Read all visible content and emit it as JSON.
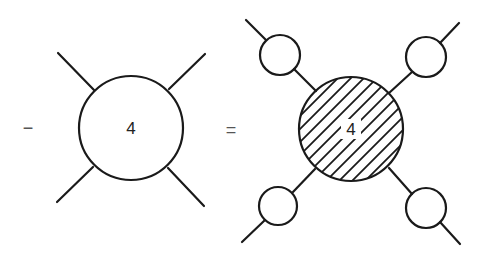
{
  "equation": {
    "lhs_operator": "−",
    "equals": "=",
    "lhs_vertex": {
      "label": "4",
      "style": "open",
      "legs": 4
    },
    "rhs_vertex": {
      "label": "4",
      "style": "hatched",
      "legs": 4,
      "leg_insertions": "open-circle-propagator"
    }
  },
  "colors": {
    "stroke": "#1a1a1a",
    "background": "#ffffff"
  }
}
